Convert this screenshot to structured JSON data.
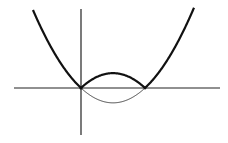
{
  "chart_data": {
    "type": "line",
    "title": "",
    "xlabel": "",
    "ylabel": "",
    "grid": false,
    "legend": null,
    "roots": [
      0,
      1
    ],
    "series": [
      {
        "name": "abs-parabola",
        "style": "thick",
        "function": "|x(x-1)|",
        "x": [
          -0.75,
          -0.5,
          -0.25,
          0,
          0.25,
          0.5,
          0.75,
          1,
          1.25,
          1.5,
          1.75
        ],
        "values": [
          1.3125,
          0.75,
          0.3125,
          0,
          0.1875,
          0.25,
          0.1875,
          0,
          0.3125,
          0.75,
          1.3125
        ]
      },
      {
        "name": "reflected-part",
        "style": "thin",
        "function": "x(x-1) for 0<=x<=1",
        "x": [
          0,
          0.25,
          0.5,
          0.75,
          1
        ],
        "values": [
          0,
          -0.1875,
          -0.25,
          -0.1875,
          0
        ]
      }
    ]
  },
  "plot": {
    "origin_px": [
      81,
      88
    ],
    "root2_px": [
      145,
      88
    ],
    "k": 0.0145,
    "x_axis_px": [
      14,
      220
    ],
    "y_axis_px": [
      9,
      135
    ],
    "curve_x_range_px": [
      33,
      194
    ],
    "colors": {
      "stroke": "#111111",
      "thin_stroke": "#333333",
      "axis": "#222222",
      "background": "#ffffff"
    }
  }
}
